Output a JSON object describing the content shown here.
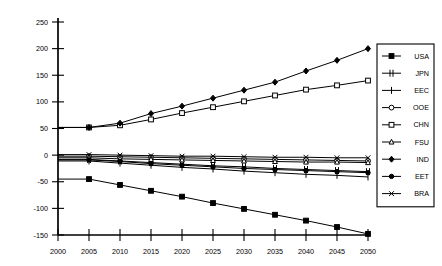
{
  "chart_data": {
    "type": "line",
    "title": "",
    "subtitle": "",
    "xlabel": "",
    "ylabel": "",
    "grid": false,
    "legend_position": "right",
    "x": [
      2000,
      2005,
      2010,
      2015,
      2020,
      2025,
      2030,
      2035,
      2040,
      2045,
      2050
    ],
    "xticks": [
      "2000",
      "2005",
      "2010",
      "2015",
      "2020",
      "2025",
      "2030",
      "2035",
      "2040",
      "2045",
      "2050"
    ],
    "yticks": [
      "-150",
      "-100",
      "-50",
      "0",
      "50",
      "100",
      "150",
      "200",
      "250"
    ],
    "ylim": [
      -150,
      250
    ],
    "xlim": [
      2000,
      2050
    ],
    "series": [
      {
        "name": "USA",
        "marker": "filled-square",
        "values": [
          -45,
          -45,
          -56,
          -67,
          -78,
          -90,
          -101,
          -112,
          -123,
          -135,
          -148
        ]
      },
      {
        "name": "JPN",
        "marker": "double-bar",
        "values": [
          -8,
          -8,
          -11,
          -14,
          -17,
          -20,
          -22,
          -25,
          -27,
          -29,
          -31
        ]
      },
      {
        "name": "EEC",
        "marker": "vertical-bar",
        "values": [
          -11,
          -11,
          -15,
          -19,
          -23,
          -26,
          -30,
          -33,
          -36,
          -38,
          -41
        ]
      },
      {
        "name": "OOE",
        "marker": "open-circle",
        "values": [
          -2,
          -2,
          -3,
          -4,
          -5,
          -6,
          -7,
          -8,
          -9,
          -10,
          -11
        ]
      },
      {
        "name": "CHN",
        "marker": "open-square",
        "values": [
          52,
          52,
          56,
          67,
          79,
          90,
          101,
          112,
          123,
          131,
          140
        ]
      },
      {
        "name": "FSU",
        "marker": "open-triangle",
        "values": [
          -5,
          -5,
          -7,
          -8,
          -9,
          -10,
          -11,
          -12,
          -13,
          -13,
          -14
        ]
      },
      {
        "name": "IND",
        "marker": "filled-diamond",
        "values": [
          52,
          52,
          60,
          78,
          92,
          107,
          122,
          137,
          158,
          178,
          200
        ]
      },
      {
        "name": "EET",
        "marker": "filled-circle",
        "values": [
          -9,
          -9,
          -12,
          -16,
          -19,
          -22,
          -25,
          -27,
          -29,
          -31,
          -33
        ]
      },
      {
        "name": "BRA",
        "marker": "cross-x",
        "values": [
          1,
          1,
          0,
          -1,
          -2,
          -2,
          -3,
          -4,
          -4,
          -5,
          -5
        ]
      }
    ]
  },
  "legend": {
    "entries": [
      "USA",
      "JPN",
      "EEC",
      "OOE",
      "CHN",
      "FSU",
      "IND",
      "EET",
      "BRA"
    ]
  },
  "colors": {
    "line": "#000000",
    "background": "#ffffff",
    "axis": "#000000"
  }
}
